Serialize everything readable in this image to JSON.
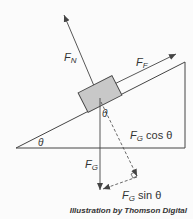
{
  "diagram": {
    "labels": {
      "normal_force": {
        "main": "F",
        "sub": "N"
      },
      "friction_force": {
        "main": "F",
        "sub": "F"
      },
      "gravity_force": {
        "main": "F",
        "sub": "G"
      },
      "gravity_parallel": {
        "main": "F",
        "sub": "G",
        "rest": "cos θ"
      },
      "gravity_perp": {
        "main": "F",
        "sub": "G",
        "rest": "sin θ"
      },
      "incline_angle": "θ",
      "block_angle": "θ"
    },
    "credit": "Illustration by Thomson Digital",
    "colors": {
      "line": "#444444",
      "block_fill": "#c8c8c8",
      "background": "#fbfbfb"
    }
  }
}
